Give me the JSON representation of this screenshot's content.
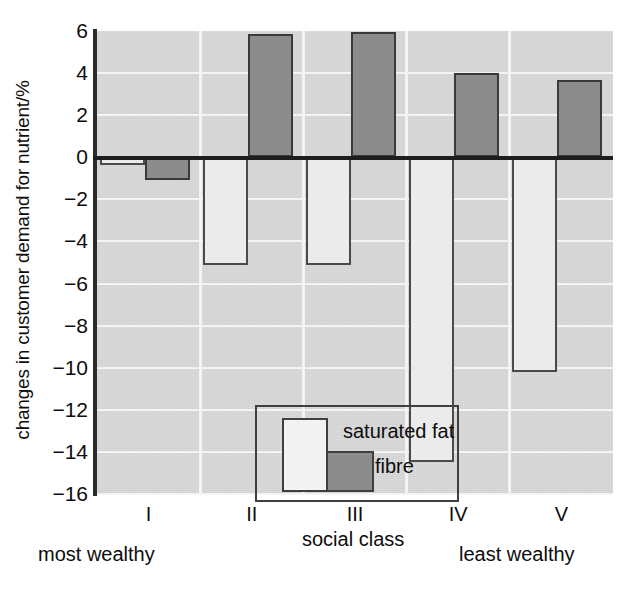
{
  "chart_data": {
    "type": "bar",
    "title": "",
    "xlabel": "social class",
    "ylabel": "changes in customer demand for nutrient/%",
    "categories": [
      "I",
      "II",
      "III",
      "IV",
      "V"
    ],
    "ylim": [
      -16,
      6
    ],
    "yticks": [
      6,
      4,
      2,
      0,
      -2,
      -4,
      -6,
      -8,
      -10,
      -12,
      -14,
      -16
    ],
    "ytick_labels": [
      "6",
      "4",
      "2",
      "0",
      "−2",
      "−4",
      "−6",
      "−8",
      "−10",
      "−12",
      "−14",
      "−16"
    ],
    "grid": true,
    "legend_position": "inside-lower-left",
    "series": [
      {
        "name": "saturated fat",
        "color": "#ebebeb",
        "edge": "#4a4a4a",
        "values": [
          -0.35,
          -5.1,
          -5.1,
          -14.5,
          -10.2
        ]
      },
      {
        "name": "fibre",
        "color": "#8c8c8c",
        "edge": "#3a3a3a",
        "values": [
          -1.1,
          5.85,
          5.95,
          4.0,
          3.65
        ]
      }
    ],
    "annotations": [
      {
        "text": "most wealthy",
        "near_category": "I"
      },
      {
        "text": "social class",
        "near_category": "III"
      },
      {
        "text": "least wealthy",
        "near_category": "V"
      }
    ]
  },
  "axis": {
    "y_title": "changes in customer demand for nutrient/%",
    "tick_labels": [
      "6",
      "4",
      "2",
      "0",
      "−2",
      "−4",
      "−6",
      "−8",
      "−10",
      "−12",
      "−14",
      "−16"
    ],
    "x_tick_labels": [
      "I",
      "II",
      "III",
      "IV",
      "V"
    ]
  },
  "legend": {
    "items": [
      {
        "label": "saturated fat",
        "swatch": "#f3f3f3"
      },
      {
        "label": "fibre",
        "swatch": "#8c8c8c"
      }
    ]
  },
  "notes": {
    "most_wealthy": "most wealthy",
    "social_class": "social class",
    "least_wealthy": "least wealthy"
  },
  "colors": {
    "plot_background": "#d9d9d9",
    "gridline": "#f4f4f4",
    "axis": "#2b2b2b",
    "saturated_fat": "#ebebeb",
    "fibre": "#8c8c8c"
  }
}
